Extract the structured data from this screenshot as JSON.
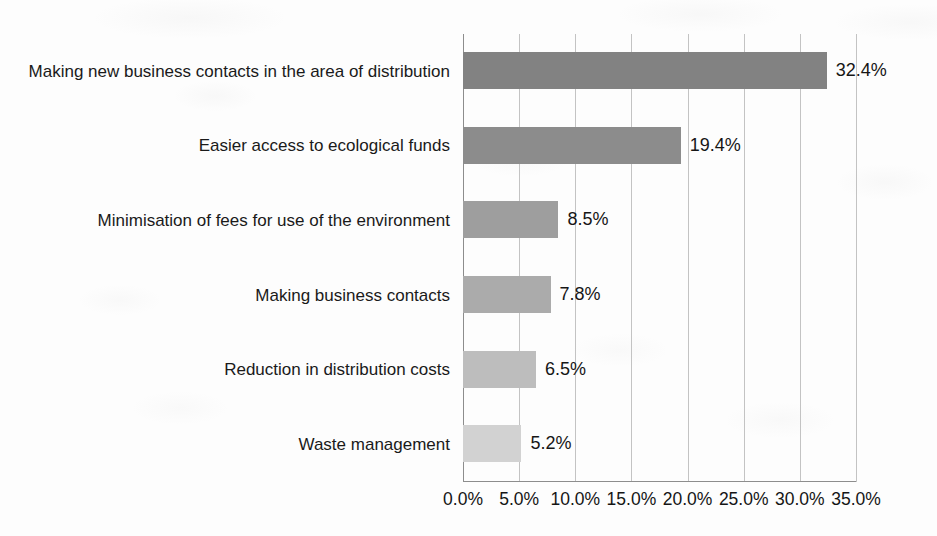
{
  "chart_data": {
    "type": "bar",
    "orientation": "horizontal",
    "title": "",
    "subtitle": "",
    "xlabel": "",
    "ylabel": "",
    "categories": [
      "Making new business contacts in the area of distribution",
      "Easier access to ecological funds",
      "Minimisation of fees for use of the environment",
      "Making business contacts",
      "Reduction in distribution costs",
      "Waste management"
    ],
    "values": [
      32.4,
      19.4,
      8.5,
      7.8,
      6.5,
      5.2
    ],
    "data_labels": [
      "32.4%",
      "19.4%",
      "8.5%",
      "7.8%",
      "6.5%",
      "5.2%"
    ],
    "bar_colors": [
      "#828282",
      "#8c8c8c",
      "#9e9e9e",
      "#ababab",
      "#bdbdbd",
      "#d2d2d2"
    ],
    "xlim": [
      0,
      35
    ],
    "tick_values": [
      0,
      5,
      10,
      15,
      20,
      25,
      30,
      35
    ],
    "tick_labels": [
      "0.0%",
      "5.0%",
      "10.0%",
      "15.0%",
      "20.0%",
      "25.0%",
      "30.0%",
      "35.0%"
    ],
    "grid": "vertical",
    "legend": "none",
    "axis_color": "#8d8d8d",
    "gridline_color": "#c3c3c3",
    "background_color": "#fdfdfd"
  }
}
